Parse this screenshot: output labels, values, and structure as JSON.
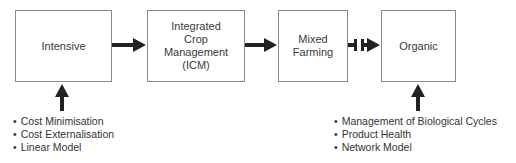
{
  "diagram": {
    "nodes": [
      {
        "id": "intensive",
        "label": "Intensive"
      },
      {
        "id": "icm",
        "label": "Integrated\nCrop\nManagement\n(ICM)"
      },
      {
        "id": "mixed",
        "label": "Mixed\nFarming"
      },
      {
        "id": "organic",
        "label": "Organic"
      }
    ],
    "edges": [
      {
        "from": "intensive",
        "to": "icm",
        "style": "solid-arrow"
      },
      {
        "from": "icm",
        "to": "mixed",
        "style": "solid-arrow"
      },
      {
        "from": "mixed",
        "to": "organic",
        "style": "broken-arrow"
      }
    ],
    "intensive_attributes": [
      "Cost Minimisation",
      "Cost Externalisation",
      "Linear Model"
    ],
    "organic_attributes": [
      "Management of Biological Cycles",
      "Product Health",
      "Network Model"
    ],
    "colors": {
      "box_border": "#8a8a8a",
      "arrow": "#222222",
      "text": "#333333"
    }
  }
}
